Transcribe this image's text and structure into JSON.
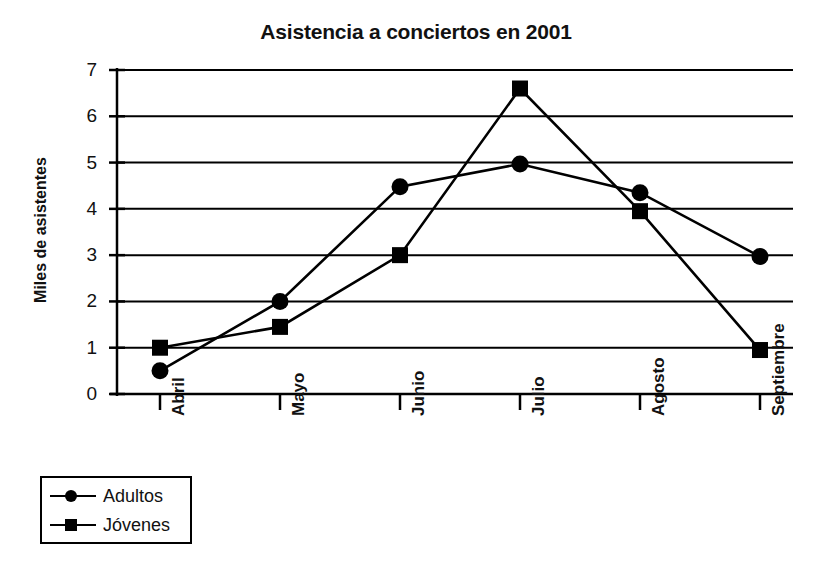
{
  "chart_data": {
    "type": "line",
    "title": "Asistencia a conciertos en 2001",
    "xlabel": "",
    "ylabel": "Miles de asistentes",
    "categories": [
      "Abril",
      "Mayo",
      "Junio",
      "Julio",
      "Agosto",
      "Septiembre"
    ],
    "series": [
      {
        "name": "Adultos",
        "marker": "circle",
        "color": "#000000",
        "values": [
          0.5,
          2.0,
          4.48,
          4.97,
          4.35,
          2.97
        ]
      },
      {
        "name": "Jóvenes",
        "marker": "square",
        "color": "#000000",
        "values": [
          1.0,
          1.45,
          3.0,
          6.6,
          3.95,
          0.95
        ]
      }
    ],
    "yticks": [
      0,
      1,
      2,
      3,
      4,
      5,
      6,
      7
    ],
    "ytick_labels": [
      "0",
      "1",
      "2",
      "3",
      "4",
      "5",
      "6",
      "7"
    ],
    "ylim": [
      0,
      7
    ],
    "grid": true,
    "grid_axis": "y",
    "legend_position": "below-left"
  }
}
